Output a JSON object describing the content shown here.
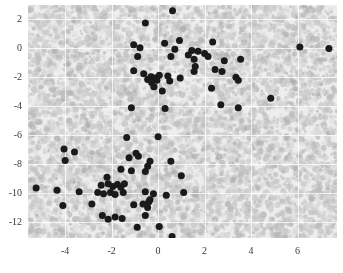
{
  "chart_data": {
    "type": "scatter",
    "title": "",
    "xlabel": "",
    "ylabel": "",
    "xlim": [
      -5.6,
      7.7
    ],
    "ylim": [
      -13.1,
      3.0
    ],
    "xticks": [
      -4,
      -2,
      0,
      2,
      4,
      6
    ],
    "xtick_labels": [
      "-4",
      "-2",
      "0",
      "2",
      "4",
      "6"
    ],
    "yticks": [
      2,
      0,
      -2,
      -4,
      -6,
      -8,
      -10,
      -12
    ],
    "ytick_labels": [
      "2",
      "0",
      "-2",
      "-4",
      "-6",
      "-8",
      "-10",
      "-12"
    ],
    "grid": true,
    "legend": null,
    "background_color": "#ededed",
    "point_color": "#1a1a1a",
    "point_size": 7,
    "series": [
      {
        "name": "cluster-upper",
        "color": "#1a1a1a",
        "points": [
          [
            0.62,
            2.6
          ],
          [
            -0.55,
            1.75
          ],
          [
            -1.05,
            0.25
          ],
          [
            -0.78,
            0.05
          ],
          [
            -0.88,
            -0.55
          ],
          [
            0.28,
            0.35
          ],
          [
            0.92,
            0.55
          ],
          [
            0.72,
            -0.05
          ],
          [
            2.35,
            0.45
          ],
          [
            1.45,
            -0.15
          ],
          [
            1.72,
            -0.2
          ],
          [
            1.3,
            -0.45
          ],
          [
            2.0,
            -0.35
          ],
          [
            2.15,
            -0.55
          ],
          [
            1.55,
            -0.75
          ],
          [
            0.55,
            -0.55
          ],
          [
            2.85,
            -0.85
          ],
          [
            3.55,
            -0.75
          ],
          [
            -1.05,
            -1.55
          ],
          [
            -0.62,
            -1.75
          ],
          [
            -0.3,
            -1.95
          ],
          [
            -0.15,
            -2.05
          ],
          [
            0.05,
            -1.85
          ],
          [
            -0.05,
            -2.2
          ],
          [
            1.6,
            -1.25
          ],
          [
            1.55,
            -1.6
          ],
          [
            2.45,
            -1.45
          ],
          [
            2.75,
            -1.6
          ],
          [
            3.35,
            -2.0
          ],
          [
            3.45,
            -2.2
          ],
          [
            -0.45,
            -2.15
          ],
          [
            -0.28,
            -2.35
          ],
          [
            0.42,
            -1.9
          ],
          [
            0.5,
            -2.25
          ],
          [
            0.95,
            -2.05
          ],
          [
            -0.18,
            -2.65
          ],
          [
            0.18,
            -2.95
          ],
          [
            2.3,
            -2.75
          ],
          [
            -1.15,
            -4.1
          ],
          [
            0.3,
            -4.15
          ],
          [
            2.7,
            -3.9
          ],
          [
            3.45,
            -4.1
          ],
          [
            4.85,
            -3.45
          ],
          [
            6.1,
            0.1
          ],
          [
            7.35,
            0.0
          ]
        ]
      },
      {
        "name": "cluster-lower",
        "color": "#1a1a1a",
        "points": [
          [
            -1.35,
            -6.15
          ],
          [
            0.0,
            -6.1
          ],
          [
            -3.6,
            -7.15
          ],
          [
            -4.05,
            -6.95
          ],
          [
            -4.0,
            -7.75
          ],
          [
            -1.25,
            -7.55
          ],
          [
            -0.85,
            -7.45
          ],
          [
            -0.95,
            -7.25
          ],
          [
            -0.35,
            -7.8
          ],
          [
            0.55,
            -7.8
          ],
          [
            -1.6,
            -8.35
          ],
          [
            -1.15,
            -8.45
          ],
          [
            -0.55,
            -8.5
          ],
          [
            -0.45,
            -8.15
          ],
          [
            -2.2,
            -8.9
          ],
          [
            1.0,
            -8.8
          ],
          [
            -2.45,
            -9.45
          ],
          [
            -2.15,
            -9.35
          ],
          [
            -1.95,
            -9.55
          ],
          [
            -1.75,
            -9.4
          ],
          [
            -1.6,
            -9.6
          ],
          [
            -1.45,
            -9.35
          ],
          [
            -5.25,
            -9.65
          ],
          [
            -4.35,
            -9.8
          ],
          [
            -3.4,
            -9.9
          ],
          [
            -2.6,
            -9.95
          ],
          [
            -2.35,
            -10.05
          ],
          [
            -2.05,
            -9.95
          ],
          [
            -1.85,
            -10.1
          ],
          [
            -1.5,
            -9.95
          ],
          [
            -0.55,
            -9.9
          ],
          [
            -0.2,
            -10.05
          ],
          [
            0.35,
            -10.15
          ],
          [
            1.1,
            -9.95
          ],
          [
            -0.35,
            -10.45
          ],
          [
            -4.1,
            -10.85
          ],
          [
            -2.85,
            -10.75
          ],
          [
            -1.05,
            -10.8
          ],
          [
            -0.65,
            -10.75
          ],
          [
            -0.45,
            -11.0
          ],
          [
            -0.4,
            -10.6
          ],
          [
            -2.4,
            -11.55
          ],
          [
            -2.15,
            -11.8
          ],
          [
            -1.85,
            -11.65
          ],
          [
            -1.55,
            -11.75
          ],
          [
            -0.55,
            -11.55
          ],
          [
            -0.9,
            -12.35
          ],
          [
            0.05,
            -12.3
          ],
          [
            0.6,
            -13.0
          ]
        ]
      }
    ]
  }
}
